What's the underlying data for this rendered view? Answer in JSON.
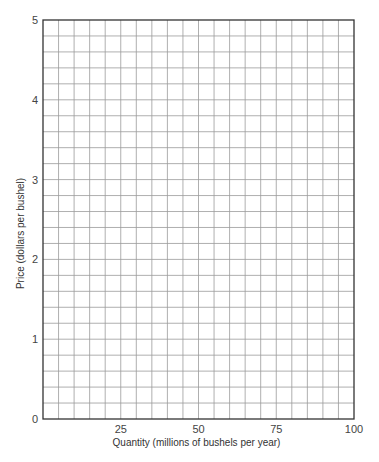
{
  "chart_data": {
    "type": "line",
    "title": "",
    "xlabel": "Quantity (millions of bushels per year)",
    "ylabel": "Price (dollars per bushel)",
    "xlim": [
      0,
      100
    ],
    "ylim": [
      0,
      5
    ],
    "x_ticks": [
      25,
      50,
      75,
      100
    ],
    "y_ticks": [
      0,
      1,
      2,
      3,
      4,
      5
    ],
    "x_tick_labels": [
      "25",
      "50",
      "75",
      "100"
    ],
    "y_tick_labels": [
      "0",
      "1",
      "2",
      "3",
      "4",
      "5"
    ],
    "grid": true,
    "grid_x_step": 5,
    "grid_y_step": 0.2,
    "series": [],
    "legend": null
  },
  "layout": {
    "plot_left": 43,
    "plot_top": 20,
    "plot_right": 354,
    "plot_bottom": 419,
    "grid_color": "#9a9a9a",
    "frame_color": "#333333"
  }
}
